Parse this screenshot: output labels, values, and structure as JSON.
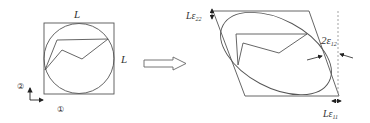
{
  "diagram": {
    "title": "",
    "left_figure": {
      "top_label": "L",
      "right_label": "L",
      "axis_2_label": "②",
      "axis_1_label": "①"
    },
    "right_figure": {
      "eps22_label_L": "Lε",
      "eps22_sub": "22",
      "eps12_label": "2ε",
      "eps12_sub": "12",
      "eps11_label_L": "Lε",
      "eps11_sub": "11"
    },
    "colors": {
      "stroke": "#555555",
      "arrow": "#222222"
    }
  }
}
